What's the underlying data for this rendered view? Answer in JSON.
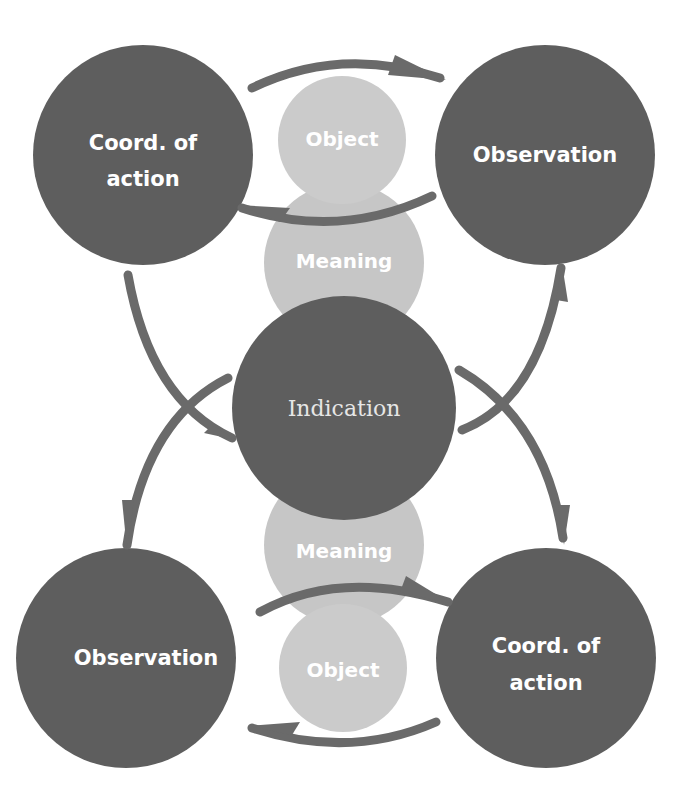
{
  "diagram": {
    "colors": {
      "dark_node": "#5e5e5e",
      "light_node": "#c6c6c6",
      "arrow": "#6a6a6a",
      "background": "#ffffff"
    },
    "center": {
      "label": "Indication"
    },
    "top_left": {
      "line1": "Coord. of",
      "line2": "action"
    },
    "top_right": {
      "label": "Observation"
    },
    "bottom_left": {
      "label": "Observation"
    },
    "bottom_right": {
      "line1": "Coord. of",
      "line2": "action"
    },
    "top_stack": {
      "object": "Object",
      "meaning": "Meaning"
    },
    "bottom_stack": {
      "meaning": "Meaning",
      "object": "Object"
    }
  }
}
